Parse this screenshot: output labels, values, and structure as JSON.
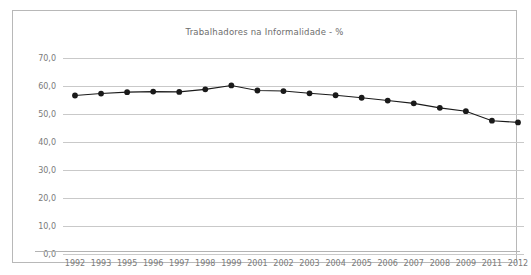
{
  "chart": {
    "title": "Trabalhadores na Informalidade - %",
    "decimal_separator": ",",
    "grid_color": "#c9c9c9",
    "series_color": "#1a1a1a",
    "frame_color": "#b8b8b8",
    "label_color": "#7a7a7a"
  },
  "chart_data": {
    "type": "line",
    "title": "Trabalhadores na Informalidade - %",
    "xlabel": "",
    "ylabel": "",
    "ylim": [
      0,
      70
    ],
    "ytick_step": 10,
    "ytick_labels": [
      "70,0",
      "60,0",
      "50,0",
      "40,0",
      "30,0",
      "20,0",
      "10,0",
      "0,0"
    ],
    "ytick_values": [
      70,
      60,
      50,
      40,
      30,
      20,
      10,
      0
    ],
    "grid": true,
    "legend": false,
    "markers": true,
    "categories": [
      "1992",
      "1993",
      "1995",
      "1996",
      "1997",
      "1998",
      "1999",
      "2001",
      "2002",
      "2003",
      "2004",
      "2005",
      "2006",
      "2007",
      "2008",
      "2009",
      "2011",
      "2012"
    ],
    "values": [
      56.6,
      57.3,
      57.8,
      58.0,
      57.9,
      58.8,
      60.2,
      58.4,
      58.2,
      57.4,
      56.7,
      55.8,
      54.8,
      53.8,
      52.2,
      51.0,
      47.6,
      47.0
    ]
  }
}
